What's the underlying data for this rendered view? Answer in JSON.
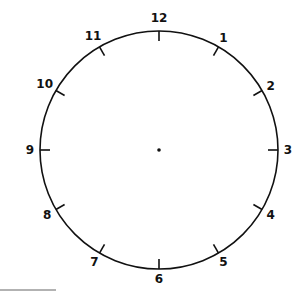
{
  "clock": {
    "center": {
      "x": 159,
      "y": 150
    },
    "radius": 119,
    "tick_length": 10,
    "label_radius": 129,
    "stroke_color": "#111111",
    "numbers": [
      "12",
      "1",
      "2",
      "3",
      "4",
      "5",
      "6",
      "7",
      "8",
      "9",
      "10",
      "11"
    ]
  },
  "footer_line": {
    "x1": 0,
    "x2": 56,
    "y": 290,
    "color": "#666666"
  }
}
